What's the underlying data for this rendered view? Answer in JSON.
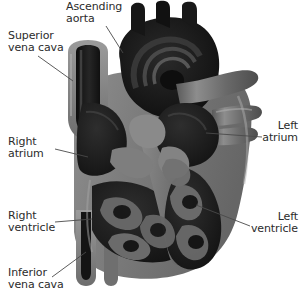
{
  "figure": {
    "background_color": "#ffffff",
    "text_color": "#2b2b2b",
    "leader_line_color": "#4a4a4a"
  },
  "palette": {
    "myocardium_gray": "#7d7d7d",
    "myocardium_light": "#9a9a9a",
    "myocardium_shadow": "#5f5f5f",
    "chamber_dark": "#1d1d1d",
    "chamber_mid": "#3a3a3a",
    "vessel_dark": "#141414",
    "highlight": "#c9c9c9"
  },
  "labels": [
    {
      "id": "ascending-aorta",
      "line1": "Ascending",
      "line2": "aorta",
      "align": "left"
    },
    {
      "id": "superior-vena-cava",
      "line1": "Superior",
      "line2": "vena cava",
      "align": "left"
    },
    {
      "id": "right-atrium",
      "line1": "Right",
      "line2": "atrium",
      "align": "left"
    },
    {
      "id": "right-ventricle",
      "line1": "Right",
      "line2": "ventricle",
      "align": "left"
    },
    {
      "id": "inferior-vena-cava",
      "line1": "Inferior",
      "line2": "vena cava",
      "align": "left"
    },
    {
      "id": "left-atrium",
      "line1": "Left",
      "line2": "atrium",
      "align": "right"
    },
    {
      "id": "left-ventricle",
      "line1": "Left",
      "line2": "ventricle",
      "align": "right"
    }
  ],
  "leaders": [
    {
      "id": "ascending-aorta",
      "x1": 106,
      "y1": 26,
      "x2": 123,
      "y2": 53
    },
    {
      "id": "superior-vena-cava",
      "x1": 38,
      "y1": 56,
      "x2": 73,
      "y2": 81
    },
    {
      "id": "right-atrium",
      "x1": 55,
      "y1": 149,
      "x2": 88,
      "y2": 157
    },
    {
      "id": "right-ventricle",
      "x1": 55,
      "y1": 222,
      "x2": 92,
      "y2": 219
    },
    {
      "id": "inferior-vena-cava",
      "x1": 52,
      "y1": 277,
      "x2": 86,
      "y2": 252
    },
    {
      "id": "left-atrium",
      "x1": 206,
      "y1": 133,
      "x2": 262,
      "y2": 137
    },
    {
      "id": "left-ventricle",
      "x1": 196,
      "y1": 205,
      "x2": 250,
      "y2": 226
    }
  ],
  "anatomy_parts": [
    "aortic arch",
    "brachiocephalic branches",
    "descending aorta",
    "superior vena cava",
    "inferior vena cava",
    "right atrium",
    "right ventricle",
    "left atrium",
    "left ventricle",
    "pulmonary veins",
    "interventricular septum",
    "trabeculae carneae",
    "papillary muscles"
  ]
}
